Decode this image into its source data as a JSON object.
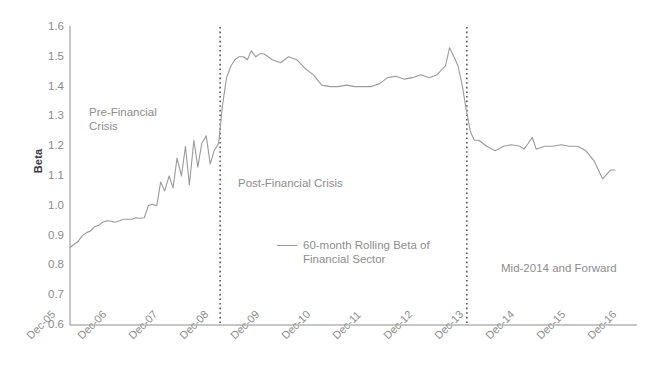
{
  "chart_data": {
    "type": "line",
    "title": "",
    "xlabel": "",
    "ylabel": "Beta",
    "ylim": [
      0.6,
      1.6
    ],
    "yticks": [
      "1.6",
      "1.5",
      "1.4",
      "1.3",
      "1.2",
      "1.1",
      "1.0",
      "0.9",
      "0.8",
      "0.7",
      "0.6"
    ],
    "grid": false,
    "legend_position": "inside-center",
    "categories": [
      "Dec-05",
      "Dec-06",
      "Dec-07",
      "Dec-08",
      "Dec-09",
      "Dec-10",
      "Dec-11",
      "Dec-12",
      "Dec-13",
      "Dec-14",
      "Dec-15",
      "Dec-16"
    ],
    "series": [
      {
        "name": "60-month Rolling Beta of Financial Sector",
        "color": "#9a9a9a",
        "x": [
          2005.92,
          2006.08,
          2006.17,
          2006.25,
          2006.33,
          2006.42,
          2006.5,
          2006.58,
          2006.67,
          2006.75,
          2006.83,
          2006.92,
          2007.0,
          2007.08,
          2007.17,
          2007.25,
          2007.33,
          2007.42,
          2007.5,
          2007.58,
          2007.67,
          2007.75,
          2007.83,
          2007.92,
          2008.0,
          2008.08,
          2008.17,
          2008.25,
          2008.33,
          2008.42,
          2008.5,
          2008.58,
          2008.67,
          2008.75,
          2008.83,
          2008.92,
          2009.0,
          2009.08,
          2009.17,
          2009.25,
          2009.33,
          2009.42,
          2009.5,
          2009.58,
          2009.67,
          2009.75,
          2009.83,
          2009.92,
          2010.0,
          2010.17,
          2010.33,
          2010.5,
          2010.67,
          2010.83,
          2011.0,
          2011.17,
          2011.33,
          2011.5,
          2011.67,
          2011.83,
          2012.0,
          2012.17,
          2012.33,
          2012.5,
          2012.67,
          2012.83,
          2013.0,
          2013.17,
          2013.33,
          2013.5,
          2013.58,
          2013.67,
          2013.75,
          2013.83,
          2013.92,
          2014.0,
          2014.08,
          2014.17,
          2014.33,
          2014.5,
          2014.67,
          2014.83,
          2015.0,
          2015.08,
          2015.17,
          2015.25,
          2015.33,
          2015.5,
          2015.67,
          2015.83,
          2016.0,
          2016.17,
          2016.33,
          2016.5,
          2016.67,
          2016.83,
          2016.92
        ],
        "values": [
          0.86,
          0.88,
          0.9,
          0.91,
          0.915,
          0.93,
          0.935,
          0.945,
          0.95,
          0.948,
          0.945,
          0.95,
          0.955,
          0.955,
          0.955,
          0.96,
          0.958,
          0.96,
          1.0,
          1.005,
          1.0,
          1.08,
          1.05,
          1.1,
          1.06,
          1.16,
          1.1,
          1.2,
          1.07,
          1.22,
          1.13,
          1.21,
          1.235,
          1.14,
          1.185,
          1.21,
          1.34,
          1.43,
          1.47,
          1.49,
          1.5,
          1.5,
          1.49,
          1.52,
          1.5,
          1.51,
          1.51,
          1.5,
          1.49,
          1.48,
          1.5,
          1.49,
          1.46,
          1.44,
          1.405,
          1.4,
          1.4,
          1.405,
          1.4,
          1.4,
          1.4,
          1.41,
          1.43,
          1.435,
          1.425,
          1.43,
          1.44,
          1.43,
          1.44,
          1.47,
          1.53,
          1.5,
          1.47,
          1.41,
          1.32,
          1.25,
          1.22,
          1.22,
          1.2,
          1.185,
          1.2,
          1.205,
          1.2,
          1.19,
          1.21,
          1.23,
          1.19,
          1.2,
          1.2,
          1.205,
          1.2,
          1.2,
          1.185,
          1.15,
          1.09,
          1.12,
          1.12
        ]
      }
    ],
    "vertical_markers": [
      {
        "label": "Dec-08",
        "x": 2008.95,
        "style": "dotted"
      },
      {
        "label": "Mid-2014",
        "x": 2013.93,
        "style": "dotted"
      }
    ],
    "annotations": [
      {
        "name": "pre-financial-crisis",
        "text": "Pre-Financial\nCrisis"
      },
      {
        "name": "post-financial-crisis",
        "text": "Post-Financial Crisis"
      },
      {
        "name": "mid-2014-and-forward",
        "text": "Mid-2014 and Forward"
      }
    ],
    "legend": {
      "label": "60-month Rolling Beta of\nFinancial Sector"
    },
    "colors": {
      "line": "#9a9a9a",
      "axis": "#8d8d8d",
      "tick_text": "#8b8b8b",
      "axis_title": "#3a3a3a",
      "annotation_text": "#8d8d8d",
      "marker": "#3d3d3d",
      "background": "#ffffff"
    }
  }
}
